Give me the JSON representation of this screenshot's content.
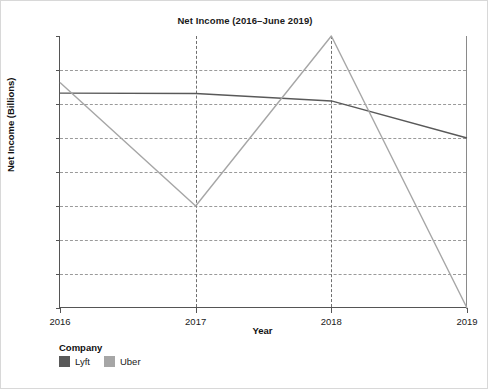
{
  "chart_data": {
    "type": "line",
    "title": "Net Income (2016–June 2019)",
    "xlabel": "Year",
    "ylabel": "Net Income (Billions)",
    "x": [
      2016,
      2017,
      2018,
      2019
    ],
    "xtick_labels": [
      "2016",
      "2017",
      "2018",
      "2019"
    ],
    "ytick_labels": [
      "$1",
      "$0",
      "$−1",
      "$−2",
      "$−3",
      "$−4",
      "$−5",
      "$−6",
      "$−7"
    ],
    "ytick_values": [
      1,
      0,
      -1,
      -2,
      -3,
      -4,
      -5,
      -6,
      -7
    ],
    "xlim": [
      2016,
      2019
    ],
    "ylim": [
      -7,
      1
    ],
    "grid": "dashed horizontal and vertical",
    "legend_position": "below-plot-left",
    "legend_title": "Company",
    "series": [
      {
        "name": "Lyft",
        "color": "#595959",
        "values": [
          -0.68,
          -0.69,
          -0.91,
          -2.0
        ]
      },
      {
        "name": "Uber",
        "color": "#a6a6a6",
        "values": [
          -0.37,
          -4.0,
          1.0,
          -7.0
        ]
      }
    ]
  },
  "legend": {
    "title": "Company",
    "items": [
      {
        "label": "Lyft",
        "color": "#595959"
      },
      {
        "label": "Uber",
        "color": "#a6a6a6"
      }
    ]
  }
}
